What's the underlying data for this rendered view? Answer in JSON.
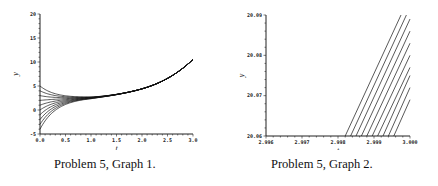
{
  "captions": {
    "graph1": "Problem 5, Graph 1.",
    "graph2": "Problem 5, Graph 2."
  },
  "chart_data": [
    {
      "type": "line",
      "title": "Problem 5, Graph 1.",
      "xlabel": "t",
      "ylabel": "y",
      "xlim": [
        0.0,
        3.0
      ],
      "ylim": [
        -5,
        20
      ],
      "x_ticks": [
        "0.0",
        "0.5",
        "1.0",
        "1.5",
        "2.0",
        "2.5",
        "3.0"
      ],
      "y_ticks": [
        "-5",
        "0",
        "5",
        "10",
        "15",
        "20"
      ],
      "grid": false,
      "description": "Family of solution curves starting at y(0) between -4 and 5, converging near t≈1 to a common curve that rises to y≈20 at t=3.",
      "series": [
        {
          "name": "y0=5",
          "x": [
            0,
            0.25,
            0.5,
            0.75,
            1.0,
            1.5,
            2.0,
            2.5,
            3.0
          ],
          "values": [
            5,
            4.0,
            3.4,
            3.1,
            3.0,
            3.6,
            6.0,
            11.0,
            20.0
          ]
        },
        {
          "name": "y0=4",
          "x": [
            0,
            0.25,
            0.5,
            0.75,
            1.0,
            1.5,
            2.0,
            2.5,
            3.0
          ],
          "values": [
            4,
            3.5,
            3.1,
            2.9,
            2.9,
            3.6,
            6.0,
            11.0,
            20.0
          ]
        },
        {
          "name": "y0=3",
          "x": [
            0,
            0.25,
            0.5,
            0.75,
            1.0,
            1.5,
            2.0,
            2.5,
            3.0
          ],
          "values": [
            3,
            2.9,
            2.8,
            2.8,
            2.9,
            3.6,
            6.0,
            11.0,
            20.0
          ]
        },
        {
          "name": "y0=2",
          "x": [
            0,
            0.25,
            0.5,
            0.75,
            1.0,
            1.5,
            2.0,
            2.5,
            3.0
          ],
          "values": [
            2,
            2.2,
            2.4,
            2.6,
            2.8,
            3.6,
            6.0,
            11.0,
            20.0
          ]
        },
        {
          "name": "y0=1",
          "x": [
            0,
            0.25,
            0.5,
            0.75,
            1.0,
            1.5,
            2.0,
            2.5,
            3.0
          ],
          "values": [
            1,
            1.6,
            2.0,
            2.4,
            2.7,
            3.6,
            6.0,
            11.0,
            20.0
          ]
        },
        {
          "name": "y0=0",
          "x": [
            0,
            0.25,
            0.5,
            0.75,
            1.0,
            1.5,
            2.0,
            2.5,
            3.0
          ],
          "values": [
            0,
            0.9,
            1.6,
            2.2,
            2.6,
            3.6,
            6.0,
            11.0,
            20.0
          ]
        },
        {
          "name": "y0=-1",
          "x": [
            0,
            0.25,
            0.5,
            0.75,
            1.0,
            1.5,
            2.0,
            2.5,
            3.0
          ],
          "values": [
            -1,
            0.3,
            1.2,
            2.0,
            2.5,
            3.6,
            6.0,
            11.0,
            20.0
          ]
        },
        {
          "name": "y0=-2",
          "x": [
            0,
            0.25,
            0.5,
            0.75,
            1.0,
            1.5,
            2.0,
            2.5,
            3.0
          ],
          "values": [
            -2,
            -0.4,
            0.8,
            1.8,
            2.4,
            3.6,
            6.0,
            11.0,
            20.0
          ]
        },
        {
          "name": "y0=-3",
          "x": [
            0,
            0.25,
            0.5,
            0.75,
            1.0,
            1.5,
            2.0,
            2.5,
            3.0
          ],
          "values": [
            -3,
            -1.1,
            0.4,
            1.6,
            2.3,
            3.6,
            6.0,
            11.0,
            20.0
          ]
        },
        {
          "name": "y0=-4",
          "x": [
            0,
            0.25,
            0.5,
            0.75,
            1.0,
            1.5,
            2.0,
            2.5,
            3.0
          ],
          "values": [
            -4,
            -1.8,
            0.0,
            1.4,
            2.2,
            3.6,
            6.0,
            11.0,
            20.0
          ]
        }
      ]
    },
    {
      "type": "line",
      "title": "Problem 5, Graph 2.",
      "xlabel": "t",
      "ylabel": "y",
      "xlim": [
        2.996,
        3.0
      ],
      "ylim": [
        20.06,
        20.09
      ],
      "x_ticks": [
        "2.996",
        "2.997",
        "2.998",
        "2.999",
        "3.000"
      ],
      "y_ticks": [
        "20.06",
        "20.07",
        "20.08",
        "20.09"
      ],
      "grid": false,
      "description": "Zoomed view near t=3: ten parallel nearly straight solution curves, crossing y=20.06 between t≈2.9982 and t≈2.9995.",
      "series": [
        {
          "name": "curve 1",
          "x": [
            2.9982,
            2.99975
          ],
          "values": [
            20.06,
            20.09
          ]
        },
        {
          "name": "curve 2",
          "x": [
            2.99835,
            2.9999
          ],
          "values": [
            20.06,
            20.09
          ]
        },
        {
          "name": "curve 3",
          "x": [
            2.9985,
            3.0
          ],
          "values": [
            20.06,
            20.089
          ]
        },
        {
          "name": "curve 4",
          "x": [
            2.99865,
            3.0
          ],
          "values": [
            20.06,
            20.086
          ]
        },
        {
          "name": "curve 5",
          "x": [
            2.9988,
            3.0
          ],
          "values": [
            20.06,
            20.083
          ]
        },
        {
          "name": "curve 6",
          "x": [
            2.99895,
            3.0
          ],
          "values": [
            20.06,
            20.08
          ]
        },
        {
          "name": "curve 7",
          "x": [
            2.9991,
            3.0
          ],
          "values": [
            20.06,
            20.077
          ]
        },
        {
          "name": "curve 8",
          "x": [
            2.99925,
            3.0
          ],
          "values": [
            20.06,
            20.075
          ]
        },
        {
          "name": "curve 9",
          "x": [
            2.9994,
            3.0
          ],
          "values": [
            20.06,
            20.072
          ]
        },
        {
          "name": "curve 10",
          "x": [
            2.99955,
            3.0
          ],
          "values": [
            20.06,
            20.069
          ]
        }
      ]
    }
  ]
}
